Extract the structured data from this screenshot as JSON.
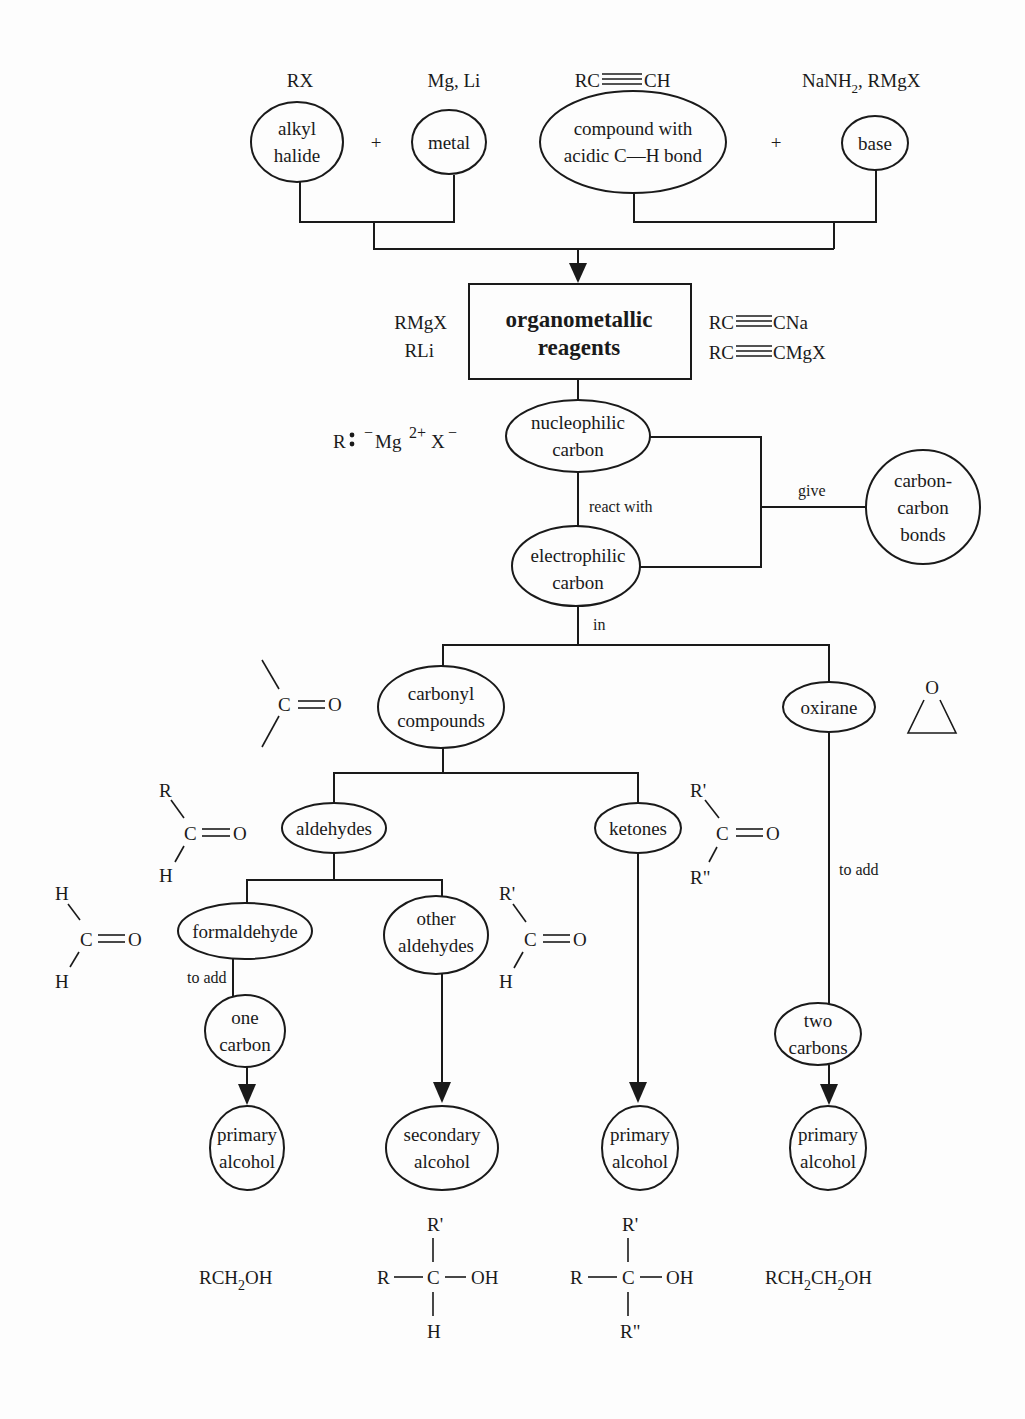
{
  "diagram": {
    "top": {
      "labels": {
        "rx": "RX",
        "metals": "Mg, Li",
        "alkyne": "RC≡CH",
        "alkyne_left": "RC",
        "alkyne_right": "CH",
        "bases": "NaNH₂, RMgX",
        "bases_a": "NaNH",
        "bases_sub": "2",
        "bases_b": ", RMgX"
      },
      "nodes": {
        "alkyl_halide": [
          "alkyl",
          "halide"
        ],
        "metal": [
          "metal"
        ],
        "acidic_compound": [
          "compound with",
          "acidic C—H bond"
        ],
        "base": [
          "base"
        ]
      },
      "plus": "+"
    },
    "center": {
      "box": [
        "organometallic",
        "reagents"
      ],
      "left_formulas": [
        "RMgX",
        "RLi"
      ],
      "right_formulas": [
        {
          "left": "RC",
          "right": "CNa"
        },
        {
          "left": "RC",
          "right": "CMgX"
        }
      ],
      "ionic_formula": {
        "r": "R",
        "dots": "∶",
        "minus": "−",
        "mg": "Mg",
        "mg_charge": "2+",
        "x": "X",
        "x_charge": "−"
      },
      "nucleophilic": [
        "nucleophilic",
        "carbon"
      ],
      "electrophilic": [
        "electrophilic",
        "carbon"
      ],
      "carbon_bonds": [
        "carbon-",
        "carbon",
        "bonds"
      ],
      "edge_labels": {
        "react_with": "react with",
        "give": "give",
        "in": "in"
      }
    },
    "branches": {
      "carbonyl": [
        "carbonyl",
        "compounds"
      ],
      "oxirane": [
        "oxirane"
      ],
      "oxirane_o": "O",
      "aldehydes": [
        "aldehydes"
      ],
      "ketones": [
        "ketones"
      ],
      "formaldehyde": [
        "formaldehyde"
      ],
      "other_aldehydes": [
        "other",
        "aldehydes"
      ],
      "one_carbon": [
        "one",
        "carbon"
      ],
      "two_carbons": [
        "two",
        "carbons"
      ],
      "to_add_1": "to add",
      "to_add_2": "to add"
    },
    "structures": {
      "carbonyl_generic": {
        "c": "C",
        "o": "O"
      },
      "aldehyde": {
        "r": "R",
        "h": "H",
        "c": "C",
        "o": "O"
      },
      "ketone": {
        "r1": "R'",
        "r2": "R\"",
        "c": "C",
        "o": "O"
      },
      "formaldehyde": {
        "h1": "H",
        "h2": "H",
        "c": "C",
        "o": "O"
      },
      "other_aldehyde": {
        "r": "R'",
        "h": "H",
        "c": "C",
        "o": "O"
      }
    },
    "products": [
      {
        "label": [
          "primary",
          "alcohol"
        ]
      },
      {
        "label": [
          "secondary",
          "alcohol"
        ]
      },
      {
        "label": [
          "primary",
          "alcohol"
        ]
      },
      {
        "label": [
          "primary",
          "alcohol"
        ]
      }
    ],
    "product_formulas": {
      "f1": {
        "a": "RCH",
        "sub": "2",
        "b": "OH"
      },
      "f2": {
        "r": "R",
        "c": "C",
        "oh": "OH",
        "top": "R'",
        "bottom": "H"
      },
      "f3": {
        "r": "R",
        "c": "C",
        "oh": "OH",
        "top": "R'",
        "bottom": "R\""
      },
      "f4": {
        "a": "RCH",
        "sub1": "2",
        "b": "CH",
        "sub2": "2",
        "c": "OH"
      }
    }
  }
}
